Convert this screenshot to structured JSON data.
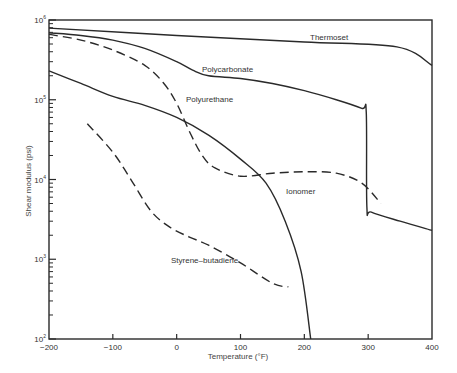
{
  "chart_data": {
    "type": "line",
    "title": "",
    "xlabel": "Temperature (°F)",
    "ylabel": "Shear modulus (psi)",
    "xlim": [
      -200,
      400
    ],
    "ylim": [
      100,
      1000000
    ],
    "yscale": "log",
    "grid": false,
    "legend": "inline labels",
    "x_ticks": [
      -200,
      -100,
      0,
      100,
      200,
      300,
      400
    ],
    "x_tick_labels": [
      "−200",
      "−100",
      "0",
      "100",
      "200",
      "300",
      "400"
    ],
    "y_ticks": [
      100,
      1000,
      10000,
      100000,
      1000000
    ],
    "y_tick_labels": [
      {
        "base": "10",
        "exp": "2"
      },
      {
        "base": "10",
        "exp": "3"
      },
      {
        "base": "10",
        "exp": "4"
      },
      {
        "base": "10",
        "exp": "5"
      },
      {
        "base": "10",
        "exp": "6"
      }
    ],
    "series": [
      {
        "name": "Thermoset",
        "style": "solid",
        "label_pos": [
          310,
          40
        ],
        "points": [
          [
            -200,
            790000
          ],
          [
            0,
            640000
          ],
          [
            200,
            530000
          ],
          [
            345,
            460000
          ],
          [
            400,
            270000
          ]
        ]
      },
      {
        "name": "Polycarbonate",
        "style": "solid",
        "label_pos": [
          202,
          72
        ],
        "points": [
          [
            -200,
            690000
          ],
          [
            -150,
            640000
          ],
          [
            -100,
            560000
          ],
          [
            -50,
            440000
          ],
          [
            0,
            300000
          ],
          [
            25,
            235000
          ],
          [
            50,
            200000
          ],
          [
            100,
            185000
          ],
          [
            150,
            160000
          ],
          [
            200,
            130000
          ],
          [
            250,
            100000
          ],
          [
            290,
            78000
          ],
          [
            297,
            70000
          ],
          [
            298,
            4500
          ],
          [
            305,
            3900
          ],
          [
            350,
            3000
          ],
          [
            400,
            2300
          ]
        ]
      },
      {
        "name": "Polyurethane",
        "style": "dashed",
        "label_pos": [
          186,
          102
        ],
        "points": [
          [
            -200,
            660000
          ],
          [
            -150,
            560000
          ],
          [
            -100,
            420000
          ],
          [
            -50,
            270000
          ],
          [
            -20,
            160000
          ],
          [
            0,
            90000
          ],
          [
            20,
            40000
          ],
          [
            40,
            20000
          ],
          [
            60,
            14000
          ],
          [
            100,
            11000
          ],
          [
            150,
            12000
          ],
          [
            200,
            12500
          ],
          [
            250,
            12000
          ],
          [
            290,
            9000
          ],
          [
            320,
            5000
          ]
        ]
      },
      {
        "name": "Ionomer",
        "style": "solid",
        "label_pos": [
          286,
          194
        ],
        "points": [
          [
            -200,
            230000
          ],
          [
            -150,
            160000
          ],
          [
            -100,
            110000
          ],
          [
            -50,
            85000
          ],
          [
            0,
            60000
          ],
          [
            50,
            36000
          ],
          [
            100,
            18000
          ],
          [
            140,
            9000
          ],
          [
            170,
            3000
          ],
          [
            195,
            700
          ],
          [
            210,
            100
          ]
        ]
      },
      {
        "name": "Styrene–butadiene",
        "style": "dashed",
        "label_pos": [
          171,
          263
        ],
        "points": [
          [
            -140,
            50000
          ],
          [
            -100,
            22000
          ],
          [
            -70,
            9500
          ],
          [
            -40,
            4000
          ],
          [
            -10,
            2500
          ],
          [
            20,
            1900
          ],
          [
            50,
            1500
          ],
          [
            100,
            900
          ],
          [
            150,
            500
          ],
          [
            175,
            450
          ]
        ]
      }
    ],
    "annotations": []
  },
  "colors": {
    "line": "#2a2a2a",
    "axis": "#2a2a2a",
    "background": "#ffffff"
  }
}
